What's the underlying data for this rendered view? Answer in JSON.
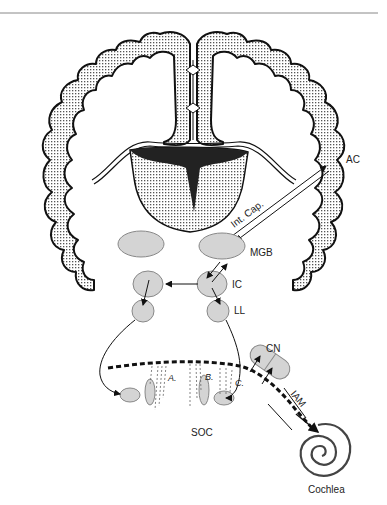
{
  "figure": {
    "type": "auditory pathway diagram",
    "labels": {
      "ac": "AC",
      "int_cap": "Int. Cap.",
      "mgb": "MGB",
      "ic": "IC",
      "ll": "LL",
      "cn": "CN",
      "iam": "IAM",
      "soc": "SOC",
      "cochlea": "Cochlea",
      "a": "A.",
      "b": "B.",
      "c": "C."
    },
    "colors": {
      "outline": "#111111",
      "nucleus_fill": "#d4d4d4",
      "cortex_stipple": "#555555",
      "background": "#ffffff"
    }
  }
}
